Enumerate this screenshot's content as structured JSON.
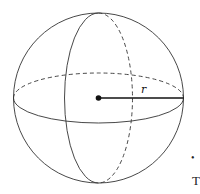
{
  "diagram": {
    "radius_label": "r",
    "colors": {
      "stroke": "#333333",
      "background": "#ffffff"
    }
  },
  "partial_text": {
    "dot": "•",
    "letter": "T"
  }
}
